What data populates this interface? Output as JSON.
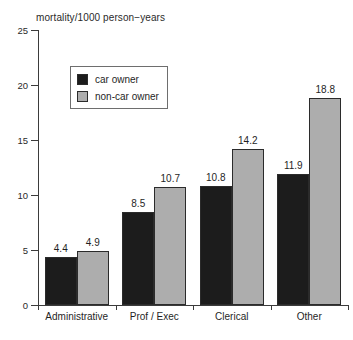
{
  "chart_data": {
    "type": "bar",
    "title": "mortality/1000 person−years",
    "xlabel": "",
    "ylabel": "",
    "ylim": [
      0,
      25
    ],
    "yticks": [
      0,
      5,
      10,
      15,
      20,
      25
    ],
    "grid": false,
    "legend_position": "upper-left-inside",
    "categories": [
      "Administrative",
      "Prof / Exec",
      "Clerical",
      "Other"
    ],
    "series": [
      {
        "name": "car owner",
        "color": "#1c1c1c",
        "values": [
          4.4,
          8.5,
          10.8,
          11.9
        ],
        "labels": [
          "4.4",
          "8.5",
          "10.8",
          "11.9"
        ]
      },
      {
        "name": "non-car owner",
        "color": "#adadad",
        "values": [
          4.9,
          10.7,
          14.2,
          18.8
        ],
        "labels": [
          "4.9",
          "10.7",
          "14.2",
          "18.8"
        ]
      }
    ]
  },
  "axis": {
    "tick_labels": [
      "25",
      "20",
      "15",
      "10",
      "5",
      "0"
    ]
  },
  "legend": {
    "items": [
      {
        "label": "car owner",
        "swatch": "dark"
      },
      {
        "label": "non-car owner",
        "swatch": "light"
      }
    ]
  }
}
